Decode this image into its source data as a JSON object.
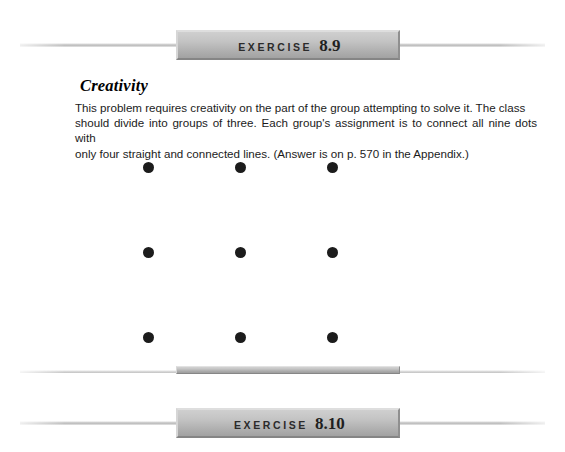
{
  "page": {
    "background_color": "#ffffff"
  },
  "top_banner": {
    "name": "exercise-banner",
    "word": "EXERCISE",
    "number": "8.9",
    "plaque_color": "#c4c4c4",
    "rule_color": "#c9c9c9"
  },
  "exercise": {
    "title": "Creativity",
    "paragraph_lines": [
      "This problem requires creativity on the part of the group attempting to solve it. The class",
      "should divide into groups of three. Each group's assignment is to connect all nine dots with",
      "only four straight and connected lines. (Answer is on p. 570 in the Appendix.)"
    ],
    "answer_page_reference": "p. 570",
    "appendix_note": "Appendix"
  },
  "dot_grid": {
    "name": "nine-dot-puzzle",
    "rows": 3,
    "columns": 3,
    "dot_count": 9,
    "dot_color": "#1c1c1c",
    "dot_diameter_px": 11,
    "column_x": [
      0,
      92,
      184
    ],
    "row_y": [
      0,
      85,
      170
    ]
  },
  "middle_divider": {
    "name": "section-divider",
    "slab_color": "#bababa"
  },
  "bottom_banner": {
    "name": "exercise-banner",
    "word": "EXERCISE",
    "number": "8.10",
    "plaque_color": "#c4c4c4",
    "rule_color": "#c9c9c9"
  }
}
